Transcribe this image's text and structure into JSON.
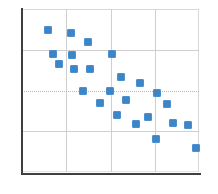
{
  "chart_data": {
    "type": "scatter",
    "title": "",
    "subtitle": "",
    "xlabel": "",
    "ylabel": "",
    "xlim": [
      0,
      10
    ],
    "ylim": [
      0,
      10
    ],
    "grid": true,
    "legend": null,
    "legend_position": "none",
    "xticks": [
      0,
      2.5,
      5,
      7.5,
      10
    ],
    "yticks": [
      0,
      2.5,
      5,
      7.5,
      10
    ],
    "xticklabels": [
      "",
      "",
      "",
      "",
      ""
    ],
    "yticklabels": [
      "",
      "",
      "",
      "",
      ""
    ],
    "marker": {
      "shape": "square",
      "color": "#3d85c6",
      "edge_color": "#4a90d0",
      "size_px": 8
    },
    "series": [
      {
        "name": "series-1",
        "color": "#3d85c6",
        "points": [
          {
            "x": 1.45,
            "y": 8.7
          },
          {
            "x": 2.75,
            "y": 8.55
          },
          {
            "x": 3.7,
            "y": 7.95
          },
          {
            "x": 1.75,
            "y": 7.25
          },
          {
            "x": 2.85,
            "y": 7.2
          },
          {
            "x": 5.1,
            "y": 7.25
          },
          {
            "x": 2.1,
            "y": 6.65
          },
          {
            "x": 2.95,
            "y": 6.3
          },
          {
            "x": 3.85,
            "y": 6.35
          },
          {
            "x": 5.6,
            "y": 5.85
          },
          {
            "x": 6.65,
            "y": 5.45
          },
          {
            "x": 3.45,
            "y": 5.0
          },
          {
            "x": 4.95,
            "y": 5.0
          },
          {
            "x": 7.6,
            "y": 4.85
          },
          {
            "x": 5.9,
            "y": 4.4
          },
          {
            "x": 4.4,
            "y": 4.25
          },
          {
            "x": 8.2,
            "y": 4.2
          },
          {
            "x": 5.35,
            "y": 3.5
          },
          {
            "x": 7.1,
            "y": 3.4
          },
          {
            "x": 6.45,
            "y": 2.95
          },
          {
            "x": 8.55,
            "y": 3.0
          },
          {
            "x": 9.35,
            "y": 2.9
          },
          {
            "x": 7.55,
            "y": 2.05
          },
          {
            "x": 9.8,
            "y": 1.5
          }
        ]
      }
    ]
  },
  "gridlines": {
    "vertical_x": [
      2.5,
      5.0,
      7.5
    ],
    "horizontal_y": [
      7.5,
      5.0,
      2.5
    ],
    "horizontal_styles": [
      "solid",
      "dotted",
      "solid"
    ]
  },
  "axes": {
    "x_axis_name": "x-axis",
    "y_axis_name": "y-axis",
    "axis_color": "#3f3f3f"
  }
}
